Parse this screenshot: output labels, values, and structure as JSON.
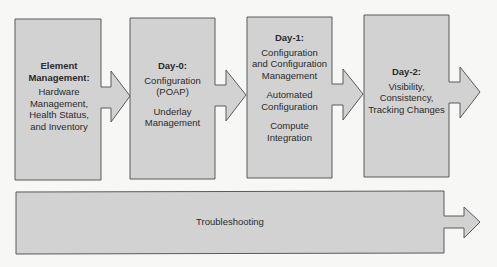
{
  "colors": {
    "background": "#f7f7f5",
    "box_fill": "#d2d2d2",
    "box_stroke": "#5a5a5a",
    "text": "#2b2b2b"
  },
  "stages": [
    {
      "title": "Element",
      "title2": "Management:",
      "lines": [
        "Hardware",
        "Management,",
        "Health Status,",
        "and Inventory"
      ]
    },
    {
      "title": "Day-0:",
      "lines": [
        "Configuration",
        "(POAP)"
      ],
      "lines2": [
        "Underlay",
        "Management"
      ]
    },
    {
      "title": "Day-1:",
      "lines": [
        "Configuration",
        "and Configuration",
        "Management"
      ],
      "lines2": [
        "Automated",
        "Configuration"
      ],
      "lines3": [
        "Compute",
        "Integration"
      ]
    },
    {
      "title": "Day-2:",
      "lines": [
        "Visibility,",
        "Consistency,",
        "Tracking Changes"
      ]
    }
  ],
  "bottom": {
    "label": "Troubleshooting"
  }
}
